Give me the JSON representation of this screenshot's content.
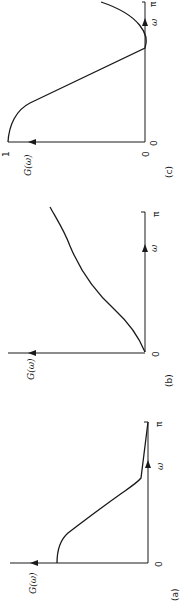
{
  "figure": {
    "orientation": "rotated 90 degrees clockwise",
    "panels": [
      {
        "id": "c",
        "caption": "(c)",
        "y_axis_label": "G(ω)",
        "x_axis_label": "ω",
        "x_origin_label": "0",
        "y_origin_label": "0",
        "y_max_label": "1",
        "x_end_label": "π"
      },
      {
        "id": "b",
        "caption": "(b)",
        "y_axis_label": "G(ω)",
        "x_axis_label": "ω",
        "x_origin_label": "0",
        "x_end_label": "π"
      },
      {
        "id": "a",
        "caption": "(a)",
        "y_axis_label": "G(ω)",
        "x_axis_label": "ω",
        "x_origin_label": "0",
        "x_end_label": "π"
      }
    ]
  }
}
